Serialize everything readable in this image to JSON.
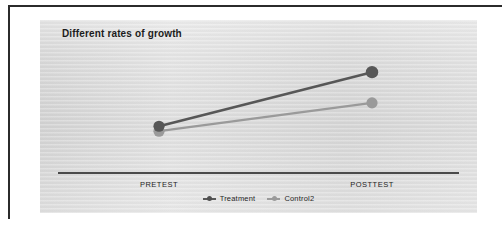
{
  "chart_data": {
    "type": "line",
    "title": "Different rates of growth",
    "xlabel": "",
    "ylabel": "",
    "categories": [
      "PRETEST",
      "POSTTEST"
    ],
    "series": [
      {
        "name": "Treatment",
        "values": [
          38,
          82
        ],
        "color": "#575757"
      },
      {
        "name": "Control2",
        "values": [
          34,
          57
        ],
        "color": "#9a9a9a"
      }
    ],
    "ylim": [
      0,
      100
    ],
    "grid": false,
    "legend_position": "bottom",
    "marker": "circle",
    "annotations": []
  },
  "axis": {
    "tick_labels": [
      "PRETEST",
      "POSTTEST"
    ],
    "baseline_color": "#4a4a4a"
  },
  "legend": {
    "items": [
      {
        "label": "Treatment",
        "color": "#575757"
      },
      {
        "label": "Control2",
        "color": "#9a9a9a"
      }
    ]
  },
  "panel": {
    "background_color": "#dedede",
    "border_color": "#2b2b2b"
  }
}
